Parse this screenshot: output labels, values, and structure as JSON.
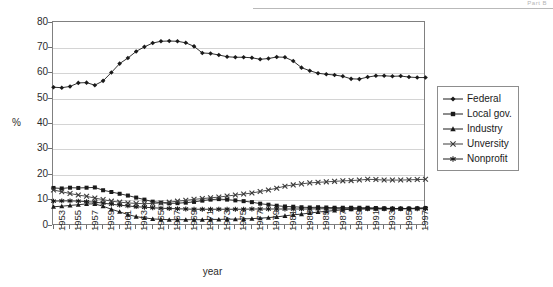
{
  "page": {
    "header_text": "Part B"
  },
  "chart_data": {
    "type": "line",
    "title": "",
    "xlabel": "year",
    "ylabel": "%",
    "ylim": [
      0,
      80
    ],
    "ytick_step": 10,
    "yticks": [
      0,
      10,
      20,
      30,
      40,
      50,
      60,
      70,
      80
    ],
    "grid": true,
    "legend_position": "right",
    "x": [
      1953,
      1954,
      1955,
      1956,
      1957,
      1958,
      1959,
      1960,
      1961,
      1962,
      1963,
      1964,
      1965,
      1966,
      1967,
      1968,
      1969,
      1970,
      1971,
      1972,
      1973,
      1974,
      1975,
      1976,
      1977,
      1978,
      1979,
      1980,
      1981,
      1982,
      1983,
      1984,
      1985,
      1986,
      1987,
      1988,
      1989,
      1990,
      1991,
      1992,
      1993,
      1994,
      1995,
      1996,
      1997,
      1998
    ],
    "xtick_labels": [
      "1953",
      "1955",
      "1957",
      "1959",
      "1961",
      "1963",
      "1965",
      "1967",
      "1969",
      "1971",
      "1973",
      "1975",
      "1977",
      "1979",
      "1981",
      "1983",
      "1985",
      "1987",
      "1989",
      "1991",
      "1993",
      "1995",
      "1997"
    ],
    "xtick_label_interval": 2,
    "series": [
      {
        "name": "Federal",
        "marker": "diamond",
        "color": "#1a1a1a",
        "values": [
          54.5,
          54.3,
          54.8,
          56.2,
          56.3,
          55.3,
          57.0,
          60.3,
          63.8,
          66.0,
          68.6,
          70.4,
          71.9,
          72.6,
          72.7,
          72.6,
          72.0,
          70.6,
          68.0,
          67.8,
          67.2,
          66.5,
          66.3,
          66.3,
          66.1,
          65.5,
          65.8,
          66.4,
          66.3,
          64.8,
          62.2,
          61.0,
          60.0,
          59.6,
          59.3,
          58.8,
          57.8,
          57.7,
          58.5,
          59.0,
          59.0,
          58.8,
          58.9,
          58.5,
          58.3,
          58.3
        ]
      },
      {
        "name": "Local gov.",
        "marker": "square",
        "color": "#1a1a1a",
        "values": [
          14.8,
          14.6,
          14.9,
          14.8,
          14.9,
          15.0,
          13.9,
          13.2,
          12.5,
          11.8,
          11.0,
          10.2,
          9.4,
          9.0,
          8.7,
          8.8,
          9.0,
          9.3,
          9.8,
          10.2,
          10.4,
          10.2,
          9.9,
          9.6,
          9.2,
          8.6,
          8.2,
          7.8,
          7.5,
          7.4,
          7.2,
          7.1,
          7.2,
          7.1,
          7.0,
          7.0,
          7.0,
          7.0,
          7.0,
          6.9,
          6.8,
          6.7,
          6.7,
          6.7,
          6.8,
          6.9
        ]
      },
      {
        "name": "Industry",
        "marker": "triangle",
        "color": "#1a1a1a",
        "values": [
          7.4,
          7.6,
          7.9,
          8.2,
          8.5,
          8.5,
          7.6,
          6.4,
          5.4,
          4.3,
          3.5,
          3.0,
          2.6,
          2.4,
          2.3,
          2.3,
          2.3,
          2.3,
          2.3,
          2.4,
          2.4,
          2.5,
          2.5,
          2.6,
          2.7,
          2.9,
          3.1,
          3.4,
          3.8,
          4.2,
          4.5,
          4.9,
          5.3,
          5.6,
          5.9,
          6.2,
          6.4,
          6.5,
          6.6,
          6.6,
          6.6,
          6.6,
          6.6,
          6.7,
          6.8,
          6.9
        ]
      },
      {
        "name": "Unversity",
        "marker": "x",
        "color": "#3a3a3a",
        "values": [
          14.0,
          13.3,
          12.6,
          12.0,
          11.5,
          10.8,
          10.2,
          9.6,
          9.2,
          8.9,
          8.7,
          8.6,
          8.7,
          8.9,
          9.2,
          9.6,
          9.9,
          10.3,
          10.6,
          10.9,
          11.2,
          11.6,
          12.0,
          12.4,
          12.8,
          13.4,
          14.0,
          14.7,
          15.5,
          16.0,
          16.4,
          16.8,
          17.0,
          17.2,
          17.4,
          17.6,
          17.7,
          17.9,
          18.2,
          18.1,
          17.9,
          17.9,
          17.9,
          18.0,
          18.1,
          18.2
        ]
      },
      {
        "name": "Nonprofit",
        "marker": "star",
        "color": "#1a1a1a",
        "values": [
          9.6,
          9.7,
          9.7,
          9.6,
          9.4,
          9.2,
          8.8,
          8.4,
          8.0,
          7.7,
          7.4,
          7.2,
          7.0,
          6.8,
          6.7,
          6.6,
          6.5,
          6.4,
          6.4,
          6.4,
          6.4,
          6.4,
          6.4,
          6.4,
          6.5,
          6.5,
          6.5,
          6.5,
          6.5,
          6.5,
          6.5,
          6.5,
          6.6,
          6.6,
          6.6,
          6.6,
          6.6,
          6.6,
          6.6,
          6.6,
          6.6,
          6.6,
          6.6,
          6.6,
          6.6,
          6.6
        ]
      }
    ]
  }
}
